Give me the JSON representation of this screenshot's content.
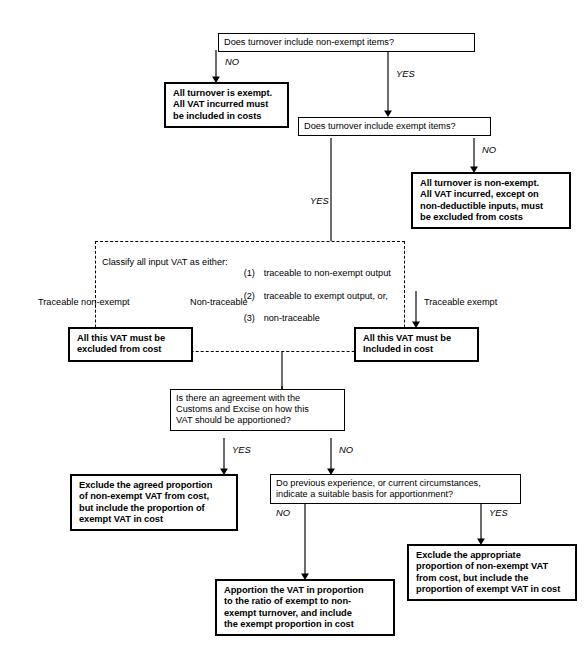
{
  "diagram": {
    "line_color": "#000000",
    "background": "#ffffff"
  },
  "nodes": {
    "q_nonexempt": {
      "label": "Does turnover include non-exempt items?"
    },
    "a_all_exempt": {
      "label": "All turnover is exempt.\nAll VAT incurred must\nbe included in costs"
    },
    "q_exempt": {
      "label": "Does turnover include exempt items?"
    },
    "a_all_nonexempt": {
      "label": "All turnover is non-exempt.\nAll VAT incurred, except on\nnon-deductible inputs, must\nbe excluded from costs"
    },
    "classify": {
      "lead": "Classify all input VAT as either:",
      "options": [
        {
          "num": "(1)",
          "text": "traceable to non-exempt output"
        },
        {
          "num": "(2)",
          "text": "traceable to exempt output, or,"
        },
        {
          "num": "(3)",
          "text": "non-traceable"
        }
      ]
    },
    "a_excluded_cost": {
      "label": "All this VAT must be\nexcluded from cost"
    },
    "a_included_cost": {
      "label": "All this VAT must be\nIncluded in cost"
    },
    "q_agreement": {
      "label": "Is there an agreement with the\nCustoms and Excise on how this\nVAT should be apportioned?"
    },
    "a_agreed_proportion": {
      "label": "Exclude the agreed proportion\nof non-exempt VAT from cost,\nbut include the proportion of\nexempt VAT in cost"
    },
    "q_previous_experience": {
      "label": "Do previous experience, or current circumstances,\nindicate a suitable basis for apportionment?"
    },
    "a_apportion": {
      "label": "Apportion the VAT in proportion\nto the ratio of exempt to non-\nexempt turnover, and include\nthe exempt proportion in cost"
    },
    "a_appropriate_proportion": {
      "label": "Exclude the appropriate\nproportion of non-exempt VAT\nfrom cost, but include the\nproportion of exempt VAT in cost"
    }
  },
  "edge_labels": {
    "no_1": "NO",
    "yes_1": "YES",
    "no_2": "NO",
    "yes_2": "YES",
    "branch_traceable_nonexempt": "Traceable non-exempt",
    "branch_nontraceable": "Non-traceable",
    "branch_traceable_exempt": "Traceable exempt",
    "yes_3": "YES",
    "no_3": "NO",
    "no_4": "NO",
    "yes_4": "YES"
  }
}
